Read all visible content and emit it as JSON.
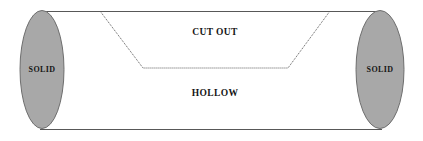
{
  "diagram": {
    "canvas": {
      "width": 423,
      "height": 141
    },
    "colors": {
      "background": "#ffffff",
      "ellipse_fill": "#a8a8a8",
      "ellipse_stroke": "#6e6e6e",
      "body_line": "#585858",
      "cut_line": "#5a5a5a",
      "label_text": "#161616"
    },
    "labels": {
      "left_end": "SOLID",
      "right_end": "SOLID",
      "cut_out": "CUT OUT",
      "hollow": "HOLLOW"
    },
    "label_positions": {
      "left_end": {
        "x": 42,
        "y": 70
      },
      "right_end": {
        "x": 380,
        "y": 70
      },
      "cut_out": {
        "x": 215,
        "y": 33
      },
      "hollow": {
        "x": 215,
        "y": 94
      }
    },
    "geometry": {
      "left_ellipse": {
        "cx": 42,
        "cy": 69.5,
        "rx": 22,
        "ry": 59
      },
      "right_ellipse": {
        "cx": 380,
        "cy": 69.5,
        "rx": 24,
        "ry": 59
      },
      "top_line": {
        "x1": 42,
        "y1": 11,
        "x2": 382,
        "y2": 11
      },
      "bottom_line": {
        "x1": 40,
        "y1": 129,
        "x2": 382,
        "y2": 129
      },
      "cut_path": "M 100 11 L 143 68 L 288 68 L 330 11"
    }
  }
}
